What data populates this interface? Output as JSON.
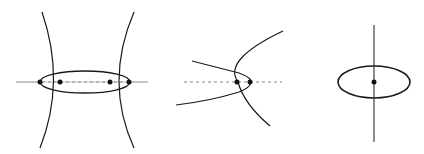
{
  "figure": {
    "panels": [
      {
        "name": "panel-1-ellipse-hyperbola-four-intersections"
      },
      {
        "name": "panel-2-ellipse-parabola-two-intersections"
      },
      {
        "name": "panel-3-ellipse-line-center-point"
      }
    ],
    "colors": {
      "stroke": "#1a1a1a",
      "dashed": "#888888",
      "background": "#ffffff"
    }
  }
}
